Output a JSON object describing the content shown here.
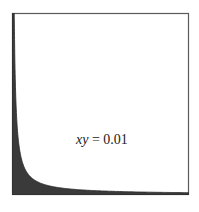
{
  "figure": {
    "equation_label": {
      "var": "xy",
      "rest": " = 0.01"
    },
    "colors": {
      "frame": "#555555",
      "fill": "#3a3a3a",
      "background": "#ffffff"
    }
  },
  "chart_data": {
    "type": "area",
    "title": "",
    "annotation": "xy = 0.01",
    "function": "y = 0.01 / x",
    "xlim": [
      0,
      1
    ],
    "ylim": [
      0,
      1
    ],
    "x": [
      0.01,
      0.02,
      0.05,
      0.1,
      0.2,
      0.5,
      1.0
    ],
    "y": [
      1.0,
      0.5,
      0.2,
      0.1,
      0.05,
      0.02,
      0.01
    ],
    "fill": "region under curve shaded",
    "grid": false,
    "xlabel": "",
    "ylabel": ""
  }
}
